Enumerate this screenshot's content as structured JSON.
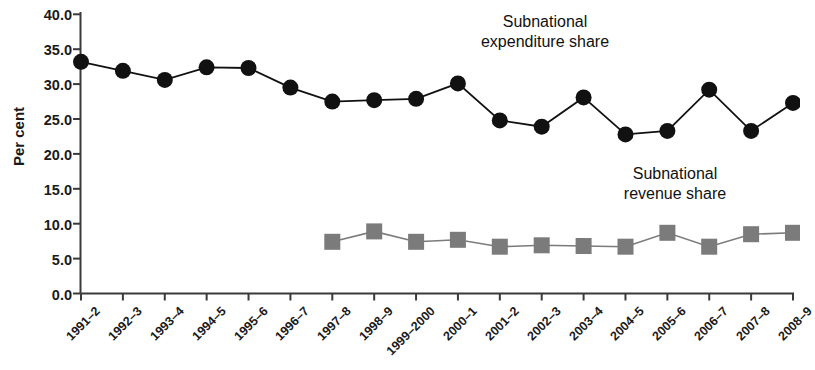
{
  "chart_data": {
    "type": "line",
    "title": "",
    "subtitle": "",
    "xlabel": "",
    "ylabel": "Per cent",
    "ylim": [
      0.0,
      40.0
    ],
    "ytick_labels": [
      "0.0",
      "5.0",
      "10.0",
      "15.0",
      "20.0",
      "25.0",
      "30.0",
      "35.0",
      "40.0"
    ],
    "ytick_values": [
      0.0,
      5.0,
      10.0,
      15.0,
      20.0,
      25.0,
      30.0,
      35.0,
      40.0
    ],
    "grid": false,
    "legend_position": "inline-annotation",
    "categories": [
      "1991–2",
      "1992–3",
      "1993–4",
      "1994–5",
      "1995–6",
      "1996–7",
      "1997–8",
      "1998–9",
      "1999–2000",
      "2000–1",
      "2001–2",
      "2002–3",
      "2003–4",
      "2004–5",
      "2005–6",
      "2006–7",
      "2007–8",
      "2008–9"
    ],
    "series": [
      {
        "name": "Subnational expenditure share",
        "marker": "circle",
        "color": "#111111",
        "values": [
          33.2,
          31.9,
          30.6,
          32.4,
          32.3,
          29.5,
          27.5,
          27.7,
          27.9,
          30.1,
          24.8,
          23.9,
          28.1,
          22.8,
          23.3,
          29.2,
          23.3,
          27.3
        ]
      },
      {
        "name": "Subnational revenue share",
        "marker": "square",
        "color": "#7b7b7b",
        "values": [
          null,
          null,
          null,
          null,
          null,
          null,
          7.4,
          8.9,
          7.4,
          7.7,
          6.7,
          6.9,
          6.8,
          6.7,
          8.7,
          6.7,
          8.5,
          8.7
        ]
      }
    ],
    "annotations": [
      {
        "id": "expenditure",
        "text": "Subnational\nexpenditure share"
      },
      {
        "id": "revenue",
        "text": "Subnational\nrevenue share"
      }
    ]
  }
}
